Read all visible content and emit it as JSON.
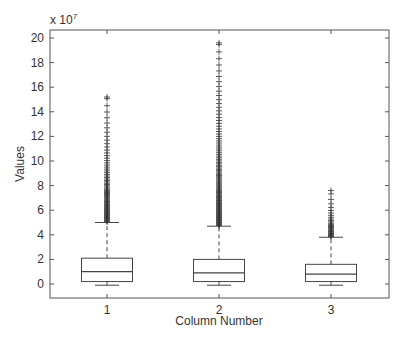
{
  "chart_data": {
    "type": "box",
    "title": "",
    "xlabel": "Column Number",
    "ylabel": "Values",
    "y_exponent_label": "x 10",
    "y_exponent_power": "7",
    "y_scale": 10000000,
    "ylim": [
      -1,
      20.2
    ],
    "yticks": [
      0,
      2,
      4,
      6,
      8,
      10,
      12,
      14,
      16,
      18,
      20
    ],
    "categories": [
      "1",
      "2",
      "3"
    ],
    "boxes": [
      {
        "label": "1",
        "lower_whisker": -0.1,
        "q1": 0.2,
        "median": 1.0,
        "q3": 2.1,
        "upper_whisker": 5.0,
        "outlier_max": 15.2
      },
      {
        "label": "2",
        "lower_whisker": -0.1,
        "q1": 0.2,
        "median": 0.9,
        "q3": 2.0,
        "upper_whisker": 4.7,
        "outlier_max": 19.6
      },
      {
        "label": "3",
        "lower_whisker": -0.1,
        "q1": 0.2,
        "median": 0.8,
        "q3": 1.6,
        "upper_whisker": 3.8,
        "outlier_max": 7.6
      }
    ],
    "grid": false,
    "legend": null
  },
  "colors": {
    "axis": "#555555",
    "box": "#444444",
    "outlier": "#333333"
  }
}
